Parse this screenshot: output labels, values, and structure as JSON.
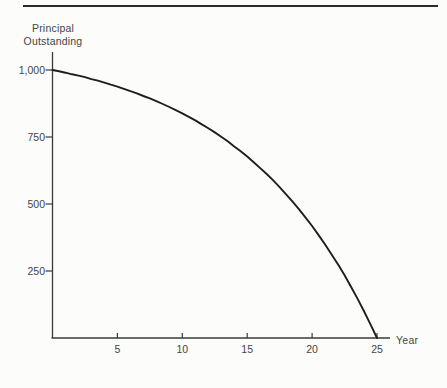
{
  "figure": {
    "background": "#fcfcfa",
    "top_rule_color": "#2b2b2b",
    "axis_color": "#3a3a3a",
    "text_color": "#454545"
  },
  "chart_data": {
    "type": "line",
    "title": "",
    "ylabel": "Principal\nOutstanding",
    "xlabel": "Year",
    "x_ticks": [
      "5",
      "10",
      "15",
      "20",
      "25"
    ],
    "x_tick_values": [
      5,
      10,
      15,
      20,
      25
    ],
    "y_ticks": [
      "1,000",
      "750",
      "500",
      "250"
    ],
    "y_tick_values": [
      1000,
      750,
      500,
      250
    ],
    "xlim": [
      0,
      25
    ],
    "ylim": [
      0,
      1000
    ],
    "grid": false,
    "legend": false,
    "series": [
      {
        "name": "Principal Outstanding",
        "color": "#1e1e1e",
        "points": [
          [
            0,
            1000
          ],
          [
            0.5,
            995
          ],
          [
            1,
            990
          ],
          [
            1.5,
            984
          ],
          [
            2,
            979
          ],
          [
            2.5,
            973
          ],
          [
            3,
            966
          ],
          [
            3.5,
            960
          ],
          [
            4,
            953
          ],
          [
            4.5,
            945
          ],
          [
            5,
            938
          ],
          [
            5.5,
            930
          ],
          [
            6,
            921
          ],
          [
            6.5,
            913
          ],
          [
            7,
            903
          ],
          [
            7.5,
            894
          ],
          [
            8,
            884
          ],
          [
            8.5,
            873
          ],
          [
            9,
            862
          ],
          [
            9.5,
            850
          ],
          [
            10,
            838
          ],
          [
            10.5,
            825
          ],
          [
            11,
            812
          ],
          [
            11.5,
            797
          ],
          [
            12,
            783
          ],
          [
            12.5,
            767
          ],
          [
            13,
            751
          ],
          [
            13.5,
            734
          ],
          [
            14,
            715
          ],
          [
            14.5,
            697
          ],
          [
            15,
            677
          ],
          [
            15.5,
            656
          ],
          [
            16,
            634
          ],
          [
            16.5,
            612
          ],
          [
            17,
            588
          ],
          [
            17.5,
            563
          ],
          [
            18,
            536
          ],
          [
            18.5,
            509
          ],
          [
            19,
            480
          ],
          [
            19.5,
            449
          ],
          [
            20,
            418
          ],
          [
            20.5,
            384
          ],
          [
            21,
            349
          ],
          [
            21.5,
            312
          ],
          [
            22,
            274
          ],
          [
            22.5,
            234
          ],
          [
            23,
            191
          ],
          [
            23.5,
            147
          ],
          [
            24,
            100
          ],
          [
            24.5,
            51
          ],
          [
            25,
            0
          ]
        ]
      }
    ]
  }
}
